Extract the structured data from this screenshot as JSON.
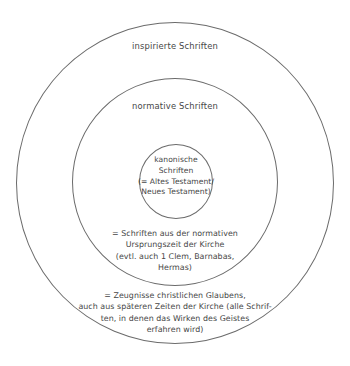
{
  "diagram": {
    "type": "concentric-circles",
    "language": "de",
    "background_color": "#ffffff",
    "stroke_color": "#6b6b6b",
    "text_color": "#464646",
    "rings": [
      {
        "id": "outer",
        "label": "inspirierte Schriften",
        "note": "= Zeugnisse christlichen Glaubens,\nauch aus späteren Zeiten der Kirche (alle Schrif-\nten, in denen das Wirken des Geistes\nerfahren wird)"
      },
      {
        "id": "middle",
        "label": "normative Schriften",
        "note": "= Schriften aus der normativen\nUrsprungszeit der Kirche\n(evtl. auch 1 Clem, Barnabas,\nHermas)"
      },
      {
        "id": "inner",
        "label": "kanonische\nSchriften\n(= Altes Testament/\nNeues Testament)",
        "note": ""
      }
    ]
  }
}
